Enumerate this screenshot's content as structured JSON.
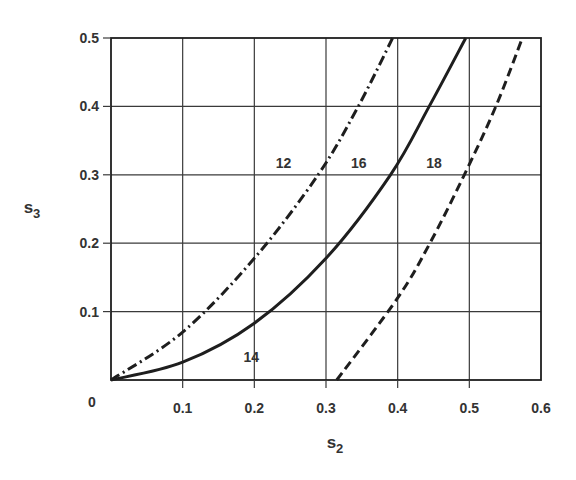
{
  "chart_data": {
    "type": "line",
    "title": "",
    "xlabel": "s2",
    "ylabel": "s3",
    "xlabel_main": "s",
    "xlabel_sub": "2",
    "ylabel_main": "s",
    "ylabel_sub": "3",
    "xlim": [
      0,
      0.6
    ],
    "ylim": [
      0,
      0.5
    ],
    "grid": true,
    "legend": "none (curves labeled inline)",
    "x_ticks": [
      "0",
      "0.1",
      "0.2",
      "0.3",
      "0.4",
      "0.5",
      "0.6"
    ],
    "y_ticks": [
      "0.1",
      "0.2",
      "0.3",
      "0.4",
      "0.5"
    ],
    "origin_label": "0",
    "series": [
      {
        "name": "12",
        "style": "dash-dot",
        "points": [
          [
            0,
            0
          ],
          [
            0.1,
            0.07
          ],
          [
            0.2,
            0.178
          ],
          [
            0.289,
            0.3
          ],
          [
            0.345,
            0.4
          ],
          [
            0.393,
            0.5
          ]
        ]
      },
      {
        "name": "16",
        "style": "solid",
        "points": [
          [
            0,
            0
          ],
          [
            0.1,
            0.026
          ],
          [
            0.2,
            0.083
          ],
          [
            0.3,
            0.178
          ],
          [
            0.39,
            0.3
          ],
          [
            0.444,
            0.4
          ],
          [
            0.495,
            0.5
          ]
        ]
      },
      {
        "name": "18",
        "style": "dashed",
        "points": [
          [
            0.315,
            0
          ],
          [
            0.4,
            0.12
          ],
          [
            0.445,
            0.2
          ],
          [
            0.493,
            0.3
          ],
          [
            0.537,
            0.4
          ],
          [
            0.574,
            0.5
          ]
        ]
      }
    ],
    "annotations": [
      {
        "text": "12",
        "x": 0.23,
        "y": 0.31
      },
      {
        "text": "16",
        "x": 0.335,
        "y": 0.31
      },
      {
        "text": "18",
        "x": 0.44,
        "y": 0.31
      },
      {
        "text": "14",
        "x": 0.185,
        "y": 0.027
      }
    ]
  },
  "colors": {
    "line": "#1e1e1e",
    "grid": "#3a3a3a",
    "background": "#ffffff"
  }
}
